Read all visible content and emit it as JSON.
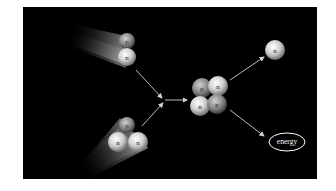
{
  "diagram": {
    "background": "#000000",
    "reactants": {
      "deuterium": {
        "particles": [
          "p",
          "n"
        ]
      },
      "tritium": {
        "particles": [
          "p",
          "n",
          "n"
        ]
      }
    },
    "products": {
      "helium": {
        "particles": [
          "p",
          "n",
          "n",
          "p"
        ]
      },
      "neutron": {
        "label": "n"
      },
      "energy": {
        "label": "energy"
      }
    },
    "labels": {
      "proton": "p",
      "neutron": "n",
      "energy": "energy"
    },
    "colors": {
      "proton": "#8a8a8a",
      "neutron": "#c8c8c8",
      "arrow": "#d0d0d0",
      "energy_ellipse": "#ffffff"
    }
  }
}
